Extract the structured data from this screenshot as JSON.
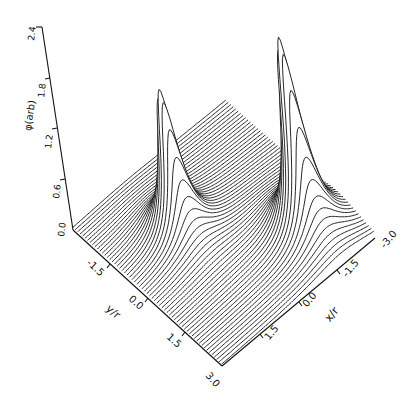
{
  "chart_data": {
    "type": "surface",
    "title": "",
    "zlabel": "φ(arb)",
    "xlabel": "x/r",
    "ylabel": "y/r",
    "z_ticks": [
      "0.0",
      "0.6",
      "1.2",
      "1.8",
      "2.4"
    ],
    "x_ticks": [
      "3.0",
      "1.5",
      "0.0",
      "-1.5",
      "-3.0"
    ],
    "y_ticks": [
      "-1.5",
      "0.0",
      "1.5",
      "3.0"
    ],
    "xlim": [
      -3.0,
      3.0
    ],
    "ylim": [
      -3.0,
      3.0
    ],
    "zlim": [
      0.0,
      2.4
    ],
    "peaks": [
      {
        "x": 0.9,
        "y": -0.8,
        "height": 1.7
      },
      {
        "x": -1.75,
        "y": 1.6,
        "height": 2.3
      }
    ],
    "grid": false,
    "legend": null
  },
  "labels": {
    "z_axis_label": "φ(arb)",
    "x_axis_label": "x/r",
    "y_axis_label": "y/r",
    "z_tick_0": "0.0",
    "z_tick_1": "0.6",
    "z_tick_2": "1.2",
    "z_tick_3": "1.8",
    "z_tick_4": "2.4",
    "y_tick_0": "-1.5",
    "y_tick_1": "0.0",
    "y_tick_2": "1.5",
    "x_tick_0": "3.0",
    "x_tick_1": "1.5",
    "x_tick_2": "0.0",
    "x_tick_3": "-1.5",
    "x_tick_4": "-3.0"
  }
}
